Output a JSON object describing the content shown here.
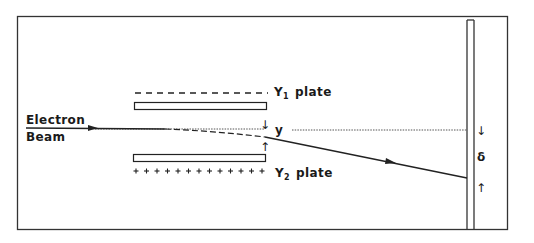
{
  "diagram": {
    "type": "cathode-ray-tube-deflection",
    "labels": {
      "beam_line1": "Electron",
      "beam_line2": "Beam",
      "y1_plate_main": "Y",
      "y1_plate_sub": "1",
      "y1_plate_word": "plate",
      "y2_plate_main": "Y",
      "y2_plate_sub": "2",
      "y2_plate_word": "plate",
      "deflection_at_plates": "y",
      "deflection_at_screen": "δ"
    },
    "charges": {
      "y1_plate": "- - - - - - - - - - - -",
      "y2_plate": "+ + + + + + + + + + + + +"
    },
    "arrows": {
      "y_top": "↓",
      "y_bottom": "↑",
      "delta_top": "↓",
      "delta_bottom": "↑"
    },
    "colors": {
      "line": "#1a1a1a",
      "background": "#ffffff",
      "dotted": "#555555"
    }
  }
}
